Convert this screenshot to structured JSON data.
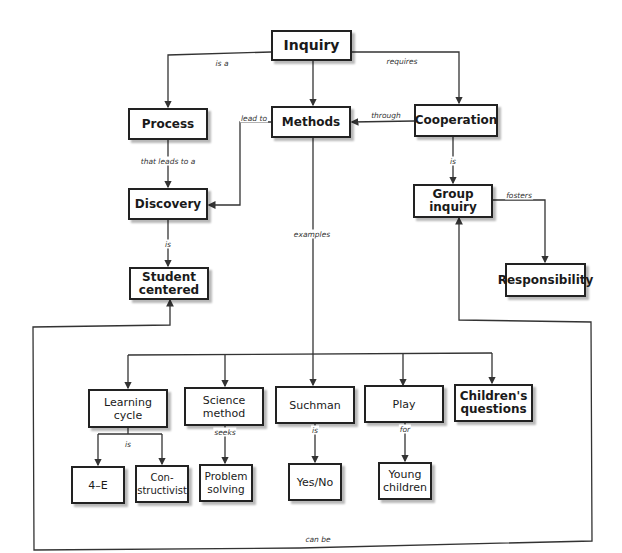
{
  "diagram": {
    "type": "concept-map",
    "nodes": {
      "inquiry": "Inquiry",
      "process": "Process",
      "methods": "Methods",
      "cooperation": "Cooperation",
      "discovery": "Discovery",
      "student_centered": "Student\ncentered",
      "group_inquiry": "Group\ninquiry",
      "responsibility": "Responsibility",
      "learning_cycle": "Learning\ncycle",
      "science_method": "Science\nmethod",
      "suchman": "Suchman",
      "play": "Play",
      "childrens_questions": "Children's\nquestions",
      "four_e": "4–E",
      "constructivist": "Con-\nstructivist",
      "problem_solving": "Problem\nsolving",
      "yes_no": "Yes/No",
      "young_children": "Young\nchildren"
    },
    "edge_labels": {
      "inquiry_process": "is a",
      "inquiry_cooperation": "requires",
      "process_discovery": "that leads to a",
      "methods_discovery": "lead to",
      "cooperation_methods": "through",
      "discovery_student": "is",
      "cooperation_group": "is",
      "group_responsibility": "fosters",
      "methods_examples": "examples",
      "learning_cycle_types": "is",
      "science_seeks": "seeks",
      "suchman_is": "is",
      "play_for": "for",
      "can_be": "can be"
    },
    "edges": [
      {
        "from": "Inquiry",
        "to": "Process",
        "label": "is a"
      },
      {
        "from": "Inquiry",
        "to": "Methods",
        "label": ""
      },
      {
        "from": "Inquiry",
        "to": "Cooperation",
        "label": "requires"
      },
      {
        "from": "Process",
        "to": "Discovery",
        "label": "that leads to a"
      },
      {
        "from": "Methods",
        "to": "Discovery",
        "label": "lead to"
      },
      {
        "from": "Cooperation",
        "to": "Methods",
        "label": "through"
      },
      {
        "from": "Discovery",
        "to": "Student centered",
        "label": "is"
      },
      {
        "from": "Cooperation",
        "to": "Group inquiry",
        "label": "is"
      },
      {
        "from": "Group inquiry",
        "to": "Responsibility",
        "label": "fosters"
      },
      {
        "from": "Methods",
        "to": "Learning cycle / Science method / Suchman / Play / Children's questions",
        "label": "examples"
      },
      {
        "from": "Learning cycle",
        "to": "4–E / Constructivist",
        "label": "is"
      },
      {
        "from": "Science method",
        "to": "Problem solving",
        "label": "seeks"
      },
      {
        "from": "Suchman",
        "to": "Yes/No",
        "label": "is"
      },
      {
        "from": "Play",
        "to": "Young children",
        "label": "for"
      },
      {
        "from": "Examples group",
        "to": "Student centered / Group inquiry",
        "label": "can be"
      }
    ]
  }
}
